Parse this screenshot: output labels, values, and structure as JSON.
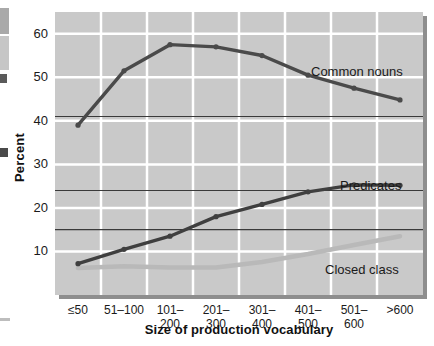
{
  "chart_data": {
    "type": "line",
    "title": "",
    "xlabel": "Size of production vocabulary",
    "ylabel": "Percent",
    "categories": [
      "≤50",
      "51–100",
      "101–200",
      "201–300",
      "301–400",
      "401–500",
      "501–600",
      ">600"
    ],
    "ylim": [
      0,
      65
    ],
    "yticks": [
      10,
      20,
      30,
      40,
      50,
      60
    ],
    "ytick_labels": [
      "10",
      "20",
      "30",
      "40",
      "50",
      "60"
    ],
    "grid": true,
    "grid_color": "#ffffff",
    "plot_background": "#c9c9c9",
    "legend_position": "inline-annotations",
    "reference_lines": [
      41,
      24,
      15
    ],
    "reference_line_color": "#3a3a3a",
    "series": [
      {
        "name": "Common nouns",
        "color": "#4a4a4a",
        "values": [
          39,
          51.5,
          57.5,
          57,
          55,
          50.5,
          47.5,
          44.8
        ]
      },
      {
        "name": "Predicates",
        "color": "#3f3f3f",
        "values": [
          7.2,
          10.5,
          13.5,
          18,
          20.8,
          23.7,
          25.3,
          25.2
        ]
      },
      {
        "name": "Closed class",
        "color": "#b9b9b9",
        "values": [
          6.2,
          6.6,
          6.3,
          6.3,
          7.6,
          9.4,
          11.5,
          13.5
        ]
      }
    ]
  },
  "annotations": {
    "common_nouns": "Common nouns",
    "predicates": "Predicates",
    "closed_class": "Closed class"
  },
  "axes": {
    "y_title": "Percent",
    "x_title": "Size of production vocabulary"
  }
}
